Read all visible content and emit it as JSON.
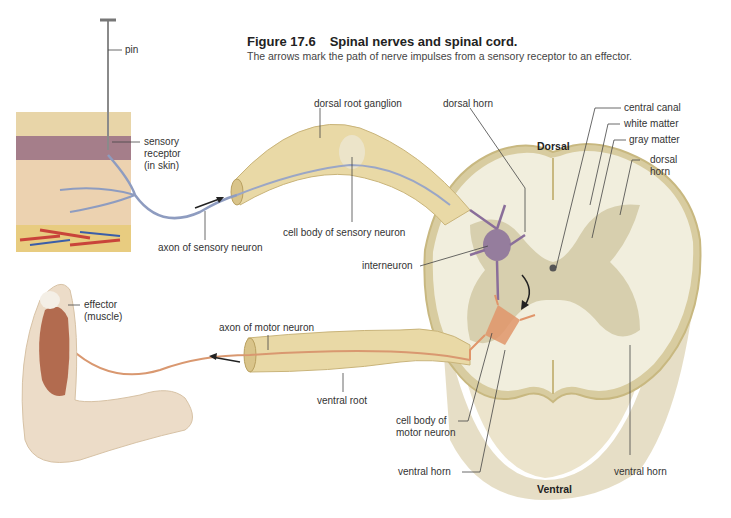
{
  "figure": {
    "number": "Figure 17.6",
    "title": "Spinal nerves and spinal cord.",
    "caption": "The arrows mark the path of nerve impulses from a sensory receptor to an effector."
  },
  "labels": {
    "pin": "pin",
    "sensory_receptor": [
      "sensory",
      "receptor",
      "(in skin)"
    ],
    "dorsal_root_ganglion": "dorsal root ganglion",
    "dorsal_horn_left": "dorsal horn",
    "central_canal": "central canal",
    "white_matter": "white matter",
    "gray_matter": "gray matter",
    "dorsal_horn_right": [
      "dorsal",
      "horn"
    ],
    "dorsal": "Dorsal",
    "cell_body_sensory": "cell body of sensory neuron",
    "axon_sensory": "axon of sensory neuron",
    "interneuron": "interneuron",
    "effector": [
      "effector",
      "(muscle)"
    ],
    "axon_motor": "axon of motor neuron",
    "ventral_root": "ventral root",
    "cell_body_motor": [
      "cell body of",
      "motor neuron"
    ],
    "ventral_horn_left": "ventral horn",
    "ventral_horn_right": "ventral horn",
    "ventral": "Ventral"
  },
  "colors": {
    "nerve": "#e8d9a8",
    "nerve_dark": "#c9b47a",
    "white_matter": "#f2efe0",
    "gray_matter": "#d9d1b0",
    "sensory_axon": "#8e9cc0",
    "motor_axon": "#d99870",
    "interneuron": "#8a6e9a",
    "motor_neuron": "#e0956a",
    "muscle": "#a8573a",
    "skin": "#e9cfae",
    "leader": "#444444"
  }
}
